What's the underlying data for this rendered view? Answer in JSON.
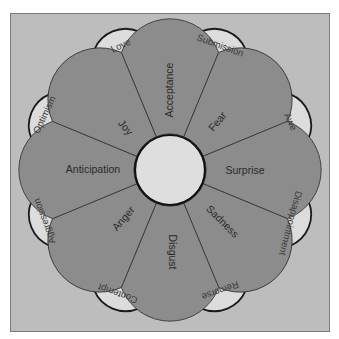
{
  "diagram": {
    "title": "",
    "colors": {
      "background": "#ffffff",
      "frame": "#bdbdbd",
      "petal": "#8c8c8c",
      "dyad": "#dcdcdc",
      "hub": "#dedede",
      "outline": "#1a1a1a"
    },
    "primary_emotions": [
      {
        "label": "Acceptance",
        "angle": 0
      },
      {
        "label": "Fear",
        "angle": 45
      },
      {
        "label": "Surprise",
        "angle": 90
      },
      {
        "label": "Sadness",
        "angle": 135
      },
      {
        "label": "Disgust",
        "angle": 180
      },
      {
        "label": "Anger",
        "angle": 225
      },
      {
        "label": "Anticipation",
        "angle": 270
      },
      {
        "label": "Joy",
        "angle": 315
      }
    ],
    "dyads": [
      {
        "label": "Submission",
        "angle": 22.5
      },
      {
        "label": "Awe",
        "angle": 67.5
      },
      {
        "label": "Disappointment",
        "angle": 112.5
      },
      {
        "label": "Remorse",
        "angle": 157.5
      },
      {
        "label": "Contempt",
        "angle": 202.5
      },
      {
        "label": "Aggression",
        "angle": 247.5
      },
      {
        "label": "Optimism",
        "angle": 292.5
      },
      {
        "label": "Love",
        "angle": 337.5
      }
    ]
  }
}
